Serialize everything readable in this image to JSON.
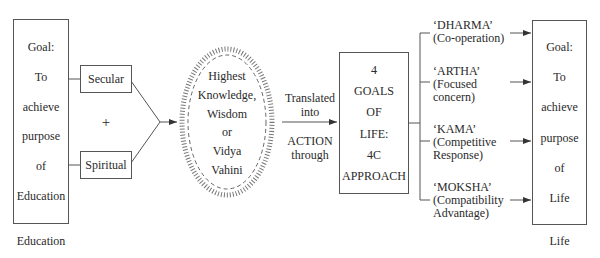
{
  "education_box": {
    "lines": [
      "Goal:",
      "To",
      "achieve",
      "purpose",
      "of",
      "Education"
    ],
    "caption": "Education"
  },
  "inputs": {
    "secular": "Secular",
    "plus": "+",
    "spiritual": "Spiritual"
  },
  "knowledge_ellipse": {
    "lines": [
      "Highest",
      "Knowledge,",
      "Wisdom",
      "or",
      "Vidya",
      "Vahini"
    ]
  },
  "connector": {
    "above": [
      "Translated",
      "into"
    ],
    "below": [
      "ACTION",
      "through"
    ]
  },
  "goals_box": {
    "lines": [
      "4",
      "GOALS",
      "OF",
      "LIFE:",
      "4C",
      "APPROACH"
    ]
  },
  "goals": [
    {
      "name": "‘DHARMA’",
      "desc": [
        "(Co-operation)"
      ]
    },
    {
      "name": "‘ARTHA’",
      "desc": [
        "(Focused",
        "concern)"
      ]
    },
    {
      "name": "‘KAMA’",
      "desc": [
        "(Competitive",
        "Response)"
      ]
    },
    {
      "name": "‘MOKSHA’",
      "desc": [
        "(Compatibility",
        "Advantage)"
      ]
    }
  ],
  "life_box": {
    "lines": [
      "Goal:",
      "To",
      "achieve",
      "purpose",
      "of",
      "Life"
    ],
    "caption": "Life"
  },
  "colors": {
    "line": "#555555",
    "text": "#2a2a2a",
    "background": "#ffffff"
  }
}
